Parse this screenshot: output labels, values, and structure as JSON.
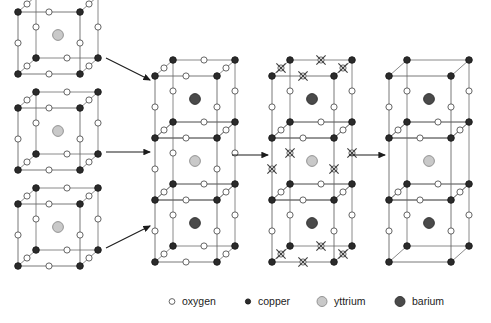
{
  "figure": {
    "title": "",
    "width": 491,
    "height": 323,
    "background": "#ffffff"
  },
  "atoms": {
    "oxygen": {
      "label": "oxygen",
      "fill": "#ffffff",
      "stroke": "#555555",
      "radius": 3.1,
      "legend_radius": 2.9
    },
    "copper": {
      "label": "copper",
      "fill": "#2b2b2b",
      "stroke": "#1a1a1a",
      "radius": 3.3,
      "legend_radius": 2.6
    },
    "yttrium": {
      "label": "yttrium",
      "fill": "#c9c9c9",
      "stroke": "#8a8a8a",
      "radius": 5.4,
      "legend_radius": 5.0
    },
    "barium": {
      "label": "barium",
      "fill": "#4a4a4a",
      "stroke": "#2e2e2e",
      "radius": 5.4,
      "legend_radius": 5.0
    }
  },
  "vacancy_marker": {
    "name": "oxygen-vacancy-cross",
    "stroke": "#3a3a3a",
    "size": 4.6
  },
  "cell_geometry": {
    "cube_width": 62,
    "cube_height": 62,
    "depth_x": 18,
    "depth_y": -16,
    "edge_stroke": "#7d7d7d",
    "edge_stroke_front": "#6a6a6a",
    "edge_width": 0.9
  },
  "columns": [
    {
      "name": "perovskite-cube-top",
      "kind": "single-cube",
      "origin_x": 18,
      "origin_y": 74,
      "center_atom": "yttrium",
      "corner_atom": "copper",
      "edge_atom": "oxygen",
      "vacancies": []
    },
    {
      "name": "perovskite-cube-middle",
      "kind": "single-cube",
      "origin_x": 18,
      "origin_y": 170,
      "center_atom": "yttrium",
      "corner_atom": "copper",
      "edge_atom": "oxygen",
      "vacancies": []
    },
    {
      "name": "perovskite-cube-bottom",
      "kind": "single-cube",
      "origin_x": 18,
      "origin_y": 266,
      "center_atom": "yttrium",
      "corner_atom": "copper",
      "edge_atom": "oxygen",
      "vacancies": []
    },
    {
      "name": "stacked-cell-full-oxygen",
      "kind": "triple-stack",
      "origin_x": 155,
      "origin_y": 262,
      "layer_centers": [
        "barium",
        "yttrium",
        "barium"
      ],
      "corner_atom": "copper",
      "edge_atom": "oxygen",
      "marked_vacancies": []
    },
    {
      "name": "stacked-cell-marked-vacancies",
      "kind": "triple-stack",
      "origin_x": 272,
      "origin_y": 262,
      "layer_centers": [
        "barium",
        "yttrium",
        "barium"
      ],
      "corner_atom": "copper",
      "edge_atom": "oxygen",
      "marked_vacancies": [
        "top-cap-edges",
        "middle-vertical-edges",
        "bottom-cap-edges"
      ]
    },
    {
      "name": "stacked-cell-oxygen-deficient",
      "kind": "triple-stack",
      "origin_x": 389,
      "origin_y": 262,
      "layer_centers": [
        "barium",
        "yttrium",
        "barium"
      ],
      "corner_atom": "copper",
      "edge_atom": "oxygen",
      "removed_vacancies": [
        "top-cap-edges",
        "middle-vertical-edges",
        "bottom-cap-edges"
      ]
    }
  ],
  "arrows": [
    {
      "name": "arrow-cube1-to-stack",
      "x1": 106,
      "y1": 58,
      "x2": 150,
      "y2": 80
    },
    {
      "name": "arrow-cube2-to-stack",
      "x1": 106,
      "y1": 152,
      "x2": 150,
      "y2": 152
    },
    {
      "name": "arrow-cube3-to-stack",
      "x1": 106,
      "y1": 248,
      "x2": 150,
      "y2": 226
    },
    {
      "name": "arrow-stack-to-marked",
      "x1": 232,
      "y1": 155,
      "x2": 268,
      "y2": 155
    },
    {
      "name": "arrow-marked-to-final",
      "x1": 349,
      "y1": 155,
      "x2": 385,
      "y2": 155
    }
  ],
  "legend": {
    "name": "atom-legend",
    "y": 305,
    "items": [
      {
        "key": "oxygen",
        "label": "oxygen",
        "marker_x": 172,
        "text_x": 182
      },
      {
        "key": "copper",
        "label": "copper",
        "marker_x": 248,
        "text_x": 258
      },
      {
        "key": "yttrium",
        "label": "yttrium",
        "marker_x": 322,
        "text_x": 334
      },
      {
        "key": "barium",
        "label": "barium",
        "marker_x": 400,
        "text_x": 412
      }
    ]
  }
}
